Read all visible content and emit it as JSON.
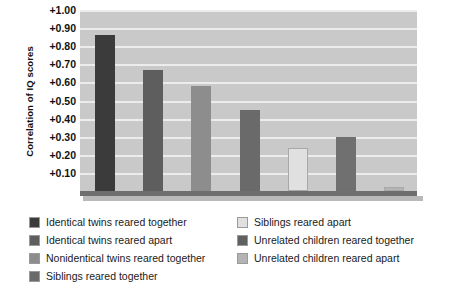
{
  "chart_data": {
    "type": "bar",
    "title": "",
    "xlabel": "",
    "ylabel": "Correlation of IQ scores",
    "ylim": [
      0,
      1.0
    ],
    "grid": true,
    "legend_position": "bottom",
    "ytick_labels": [
      "+1.00",
      "+0.90",
      "+0.80",
      "+0.70",
      "+0.60",
      "+0.50",
      "+0.40",
      "+0.30",
      "+0.20",
      "+0.10"
    ],
    "ytick_values": [
      1.0,
      0.9,
      0.8,
      0.7,
      0.6,
      0.5,
      0.4,
      0.3,
      0.2,
      0.1
    ],
    "categories": [
      "Identical twins reared together",
      "Identical twins reared apart",
      "Nonidentical twins reared together",
      "Siblings reared together",
      "Siblings reared apart",
      "Unrelated children reared together",
      "Unrelated children reared apart"
    ],
    "values": [
      0.86,
      0.67,
      0.58,
      0.45,
      0.24,
      0.3,
      0.02
    ],
    "colors": [
      "#3b3b3b",
      "#5e5e5e",
      "#8d8d8d",
      "#6a6a6a",
      "#e0e0e0",
      "#707070",
      "#b4b4b4"
    ]
  },
  "legend": {
    "left_column": [
      {
        "label": "Identical twins reared together",
        "color": "#3b3b3b"
      },
      {
        "label": "Identical twins reared apart",
        "color": "#5e5e5e"
      },
      {
        "label": "Nonidentical twins reared together",
        "color": "#8d8d8d"
      },
      {
        "label": "Siblings reared together",
        "color": "#6a6a6a"
      }
    ],
    "right_column": [
      {
        "label": "Siblings reared apart",
        "color": "#e0e0e0"
      },
      {
        "label": "Unrelated children reared together",
        "color": "#606060"
      },
      {
        "label": "Unrelated children reared apart",
        "color": "#b4b4b4"
      }
    ]
  },
  "style": {
    "plot_background": "#c9c9c9",
    "gridline_color": "#ececec",
    "baseline_color": "#6e6e6e",
    "text_color": "#111111"
  }
}
